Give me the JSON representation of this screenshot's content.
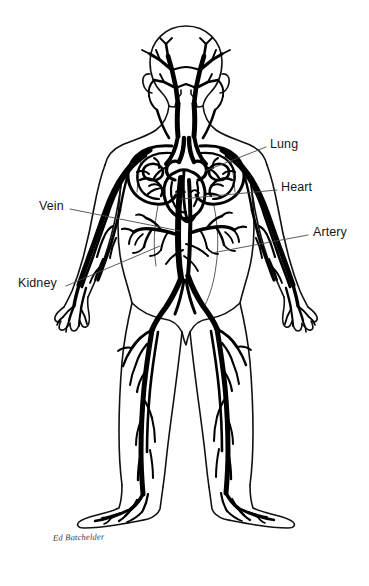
{
  "figure": {
    "style": "black-and-white line drawing",
    "background_color": "#ffffff",
    "ink_color": "#000000",
    "leader_line_color": "#4a4a4a",
    "text_color": "#171717"
  },
  "labels": [
    {
      "id": "lung",
      "text": "Lung",
      "side": "right",
      "text_x": 270,
      "text_y": 138,
      "leader_from": [
        266,
        147
      ],
      "leader_to": [
        205,
        171
      ]
    },
    {
      "id": "heart",
      "text": "Heart",
      "side": "right",
      "text_x": 281,
      "text_y": 181,
      "leader_from": [
        277,
        190
      ],
      "leader_to": [
        181,
        199
      ]
    },
    {
      "id": "artery",
      "text": "Artery",
      "side": "right",
      "text_x": 313,
      "text_y": 226,
      "leader_from": [
        308,
        235
      ],
      "leader_to": [
        212,
        253
      ]
    },
    {
      "id": "vein",
      "text": "Vein",
      "side": "left",
      "text_x": 39,
      "text_y": 200,
      "leader_from": [
        70,
        209
      ],
      "leader_to": [
        180,
        231
      ]
    },
    {
      "id": "kidney",
      "text": "Kidney",
      "side": "left",
      "text_x": 18,
      "text_y": 277,
      "leader_from": [
        66,
        286
      ],
      "leader_to": [
        160,
        246
      ]
    }
  ],
  "signature": {
    "text": "Ed Batchelder",
    "x": 53,
    "y": 532
  }
}
